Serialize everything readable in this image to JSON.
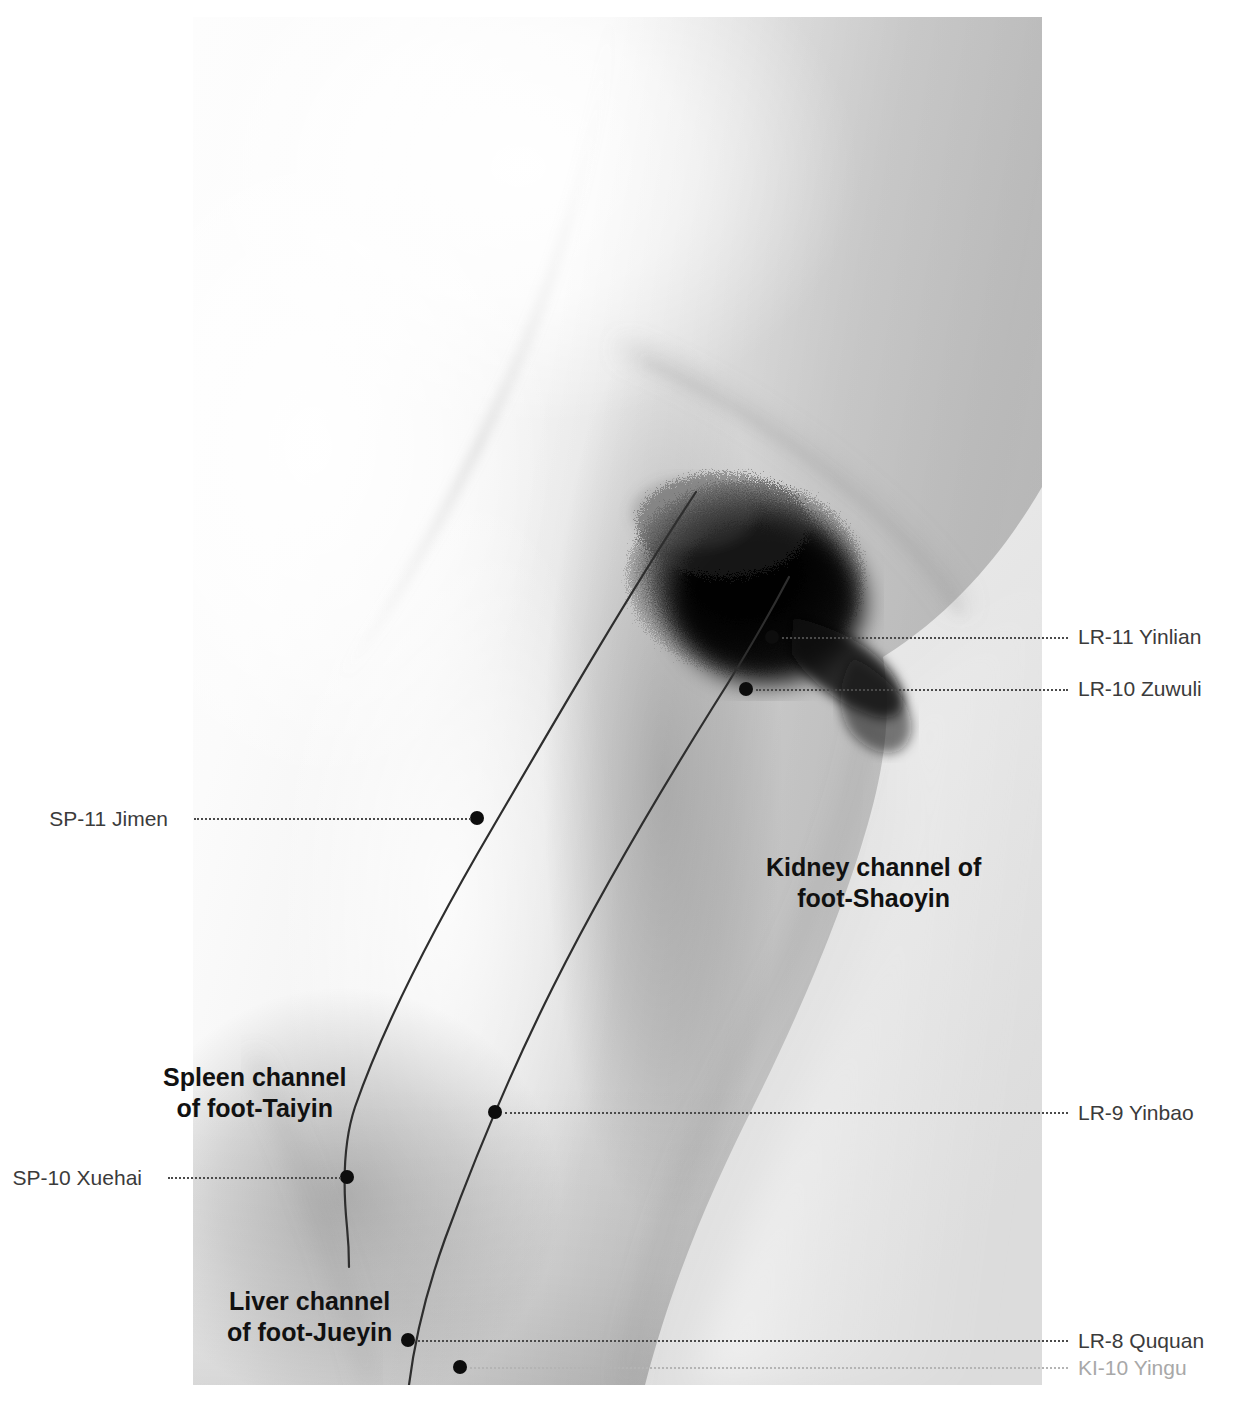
{
  "plate": {
    "width": 1235,
    "height": 1414,
    "background": "#ffffff",
    "subject": "medial-thigh-anatomical-photograph"
  },
  "photo": {
    "left": 193,
    "top": 17,
    "width": 849,
    "height": 1368,
    "description": "Grayscale photograph of the medial aspect of the right thigh, groin and knee"
  },
  "colors": {
    "label_text": "#3b3b3b",
    "label_text_muted": "#a8a8a8",
    "channel_name_text": "#111111",
    "leader_line": "#4a4a4a",
    "leader_line_muted": "#b4b4b4",
    "channel_line": "#2e2e2e",
    "point_marker": "#0d0d0d"
  },
  "channel_names": [
    {
      "id": "kidney",
      "line1": "Kidney channel of",
      "line2": "foot-Shaoyin",
      "x": 766,
      "y": 852
    },
    {
      "id": "spleen",
      "line1": "Spleen channel",
      "line2": "of foot-Taiyin",
      "x": 163,
      "y": 1062
    },
    {
      "id": "liver",
      "line1": "Liver channel",
      "line2": "of foot-Jueyin",
      "x": 227,
      "y": 1286
    }
  ],
  "points": [
    {
      "id": "lr11",
      "label": "LR-11 Yinlian",
      "side": "right",
      "muted": false,
      "marker_x": 772,
      "marker_y": 637,
      "label_y": 624,
      "leader_from": 782,
      "leader_to": 1068
    },
    {
      "id": "lr10",
      "label": "LR-10 Zuwuli",
      "side": "right",
      "muted": false,
      "marker_x": 746,
      "marker_y": 689,
      "label_y": 676,
      "leader_from": 756,
      "leader_to": 1068
    },
    {
      "id": "sp11",
      "label": "SP-11 Jimen",
      "side": "left",
      "muted": false,
      "marker_x": 477,
      "marker_y": 818,
      "label_y": 806,
      "leader_from": 194,
      "leader_to": 471
    },
    {
      "id": "lr9",
      "label": "LR-9 Yinbao",
      "side": "right",
      "muted": false,
      "marker_x": 495,
      "marker_y": 1112,
      "label_y": 1100,
      "leader_from": 505,
      "leader_to": 1068
    },
    {
      "id": "sp10",
      "label": "SP-10 Xuehai",
      "side": "left",
      "muted": false,
      "marker_x": 347,
      "marker_y": 1177,
      "label_y": 1165,
      "leader_from": 168,
      "leader_to": 341
    },
    {
      "id": "lr8",
      "label": "LR-8 Ququan",
      "side": "right",
      "muted": false,
      "marker_x": 408,
      "marker_y": 1340,
      "label_y": 1328,
      "leader_from": 418,
      "leader_to": 1068
    },
    {
      "id": "ki10",
      "label": "KI-10 Yingu",
      "side": "right",
      "muted": true,
      "marker_x": 460,
      "marker_y": 1367,
      "label_y": 1355,
      "leader_from": 470,
      "leader_to": 1068
    }
  ],
  "left_label_right_edge": {
    "sp11": 182,
    "sp10": 156
  }
}
